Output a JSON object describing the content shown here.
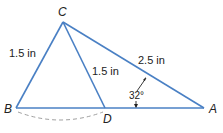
{
  "diagram": {
    "type": "geometry-triangle",
    "line_color": "#4a80c4",
    "arc_color": "#9a9a9a",
    "points": {
      "A": {
        "label": "A",
        "x": 204,
        "y": 108
      },
      "B": {
        "label": "B",
        "x": 16,
        "y": 108
      },
      "C": {
        "label": "C",
        "x": 63,
        "y": 22
      },
      "D": {
        "label": "D",
        "x": 105,
        "y": 108
      }
    },
    "segments": [
      {
        "from": "C",
        "to": "B",
        "length_label": "1.5 in"
      },
      {
        "from": "C",
        "to": "D",
        "length_label": "1.5 in"
      },
      {
        "from": "C",
        "to": "A",
        "length_label": "2.5 in"
      },
      {
        "from": "B",
        "to": "A",
        "length_label": ""
      }
    ],
    "angle": {
      "vertex": "A",
      "label": "32°"
    },
    "arc": {
      "from": "B",
      "to": "D",
      "style": "dashed"
    }
  }
}
